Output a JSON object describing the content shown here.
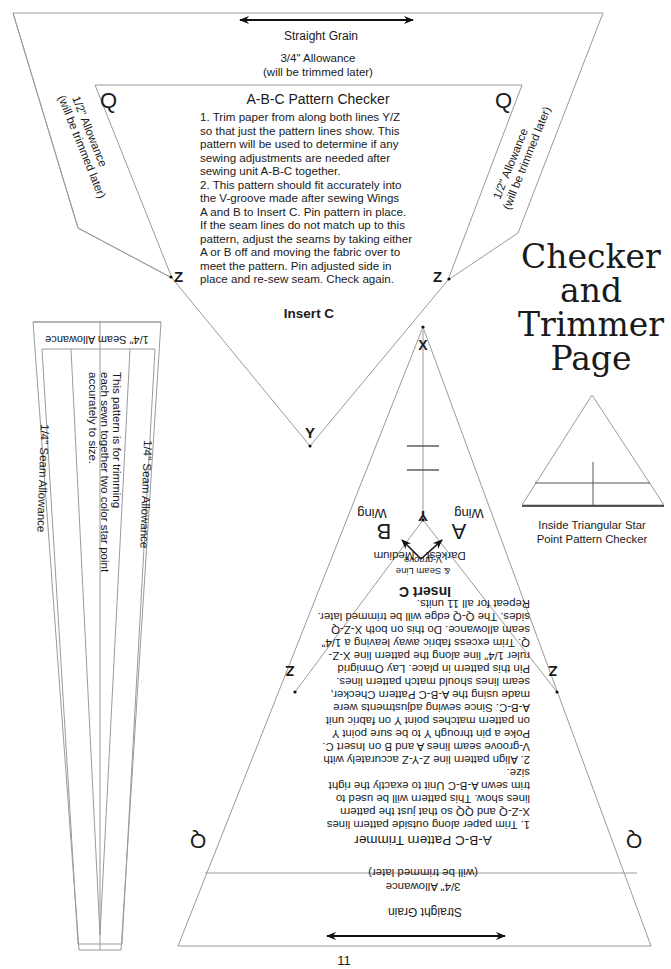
{
  "page": {
    "title_lines": [
      "Checker",
      "and",
      "Trimmer",
      "Page"
    ],
    "page_number": "11"
  },
  "checker": {
    "grain_label": "Straight Grain",
    "top_allowance": [
      "3/4\" Allowance",
      "(will be trimmed later)"
    ],
    "side_allowance": [
      "1/2\" Allowance",
      "(will be trimmed later)"
    ],
    "corner_q": "Q",
    "corner_z": "Z",
    "point_y": "Y",
    "title": "A-B-C Pattern Checker",
    "instructions": [
      "1.  Trim paper from along both lines Y/Z",
      "so that just the pattern lines show. This",
      "pattern will be used to determine if any",
      "sewing adjustments are needed after",
      "sewing unit A-B-C together.",
      "2.  This pattern should fit accurately into",
      "the V-groove made after sewing Wings",
      "A and B to Insert C. Pin pattern in place.",
      "If the seam lines do not match up to this",
      "pattern, adjust the seams by taking either",
      "A or B off and moving the fabric over to",
      "meet the pattern. Pin adjusted side in",
      "place and re-sew seam. Check again."
    ],
    "insert_label": "Insert C"
  },
  "strip": {
    "top_label": "1/4\" Seam Allowance",
    "left_label": "1/4\" Seam Allowance",
    "right_label": "1/4\" Seam Allowance",
    "description": [
      "This pattern is for trimming",
      "each sewn together two color star point",
      "accurately to size."
    ]
  },
  "small_checker": {
    "caption": [
      "Inside Triangular Star",
      "Point Pattern Checker"
    ]
  },
  "trimmer": {
    "point_x": "X",
    "point_y": "Y",
    "corner_z": "Z",
    "corner_q": "Q",
    "wing_a": {
      "word": "Wing",
      "letter": "A",
      "shade": "Darkest"
    },
    "wing_b": {
      "word": "Wing",
      "letter": "B",
      "shade": "Medium"
    },
    "vgroove_label": [
      "V-groove",
      "& Seam Line"
    ],
    "insert_label": "Insert C",
    "title": "A-B-C Pattern Trimmer",
    "instructions": [
      "1.  Trim paper along outside pattern lines",
      "X-Z-Q and QQ  so that just the pattern",
      "lines show. This pattern will be used to",
      "trim sewn A-B-C Unit to exactly the right",
      "size.",
      "2.  Align pattern line Z-Y-Z accurately with",
      "V-groove seam lines A and B on Insert C.",
      "Poke a pin through Y to be sure point Y",
      "on pattern matches point Y on fabric unit",
      "A-B-C. Since sewing adjustments were",
      "made using the A-B-C Pattern Checker,",
      "seam lines should match pattern lines.",
      "Pin this pattern in place. Lay Omnigrid",
      "ruler 1/4\" line along the pattern line X-Z-",
      "Q. Trim excess fabric away leaving a 1/4\"",
      "seam allowance. Do this on both X-Z-Q",
      "sides. The Q-Q edge will be trimmed later.",
      "Repeat for all 11 units."
    ],
    "bottom_allowance": [
      "3/4\" Allowance",
      "(will be trimmed later)"
    ],
    "grain_label": "Straight Grain"
  }
}
